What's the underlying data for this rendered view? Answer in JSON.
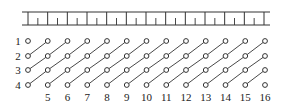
{
  "diagram": {
    "type": "grid-diagonal-connection",
    "colors": {
      "stroke": "#333333",
      "text": "#222222",
      "background": "#ffffff"
    },
    "ruler": {
      "x_start": 28,
      "x_end": 264,
      "y_top": 12,
      "y_bottom": 25,
      "long_tick_count": 13,
      "short_ticks_between": 1
    },
    "grid": {
      "rows": 4,
      "cols": 13,
      "col_x0": 28,
      "col_spacing": 19.75,
      "row_y": [
        41,
        56,
        70,
        85
      ],
      "circle_radius": 2.4
    },
    "row_labels": [
      "1",
      "2",
      "3",
      "4"
    ],
    "column_labels": [
      "5",
      "6",
      "7",
      "8",
      "9",
      "10",
      "11",
      "12",
      "13",
      "14",
      "15",
      "16"
    ],
    "connections_rule": "each circle at (row r, col c) links to (row r-1, col c+1) along anti-diagonals"
  }
}
